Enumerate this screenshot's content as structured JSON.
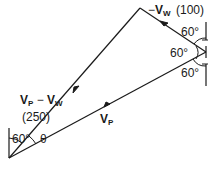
{
  "diagram": {
    "type": "vector-triangle",
    "colors": {
      "line": "#1a1a1a",
      "background": "#ffffff"
    },
    "vectors": {
      "vp_minus_vw": {
        "name": "V",
        "sub1": "P",
        "minus": " − ",
        "name2": "V",
        "sub2": "W",
        "magnitude": "(250)"
      },
      "neg_vw": {
        "prefix": "−",
        "name": "V",
        "sub": "W",
        "magnitude": "(100)"
      },
      "vp": {
        "name": "V",
        "sub": "P"
      }
    },
    "angles": {
      "origin_vertical": "60°",
      "theta": "θ",
      "right_top": "60°",
      "right_middle": "60°",
      "right_bottom": "60°"
    }
  }
}
